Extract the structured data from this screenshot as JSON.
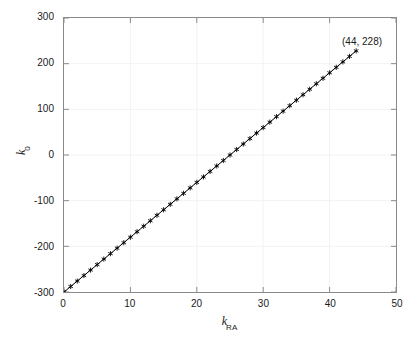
{
  "chart_data": {
    "type": "line",
    "title": "",
    "subtitle": "",
    "xlabel": "k_RA",
    "xlabel_base": "k",
    "xlabel_sub": "RA",
    "ylabel": "k_0",
    "ylabel_base": "k",
    "ylabel_sub": "0",
    "xlim": [
      0,
      50
    ],
    "ylim": [
      -300,
      300
    ],
    "xticks": [
      0,
      10,
      20,
      30,
      40,
      50
    ],
    "yticks": [
      -300,
      -200,
      -100,
      0,
      100,
      200,
      300
    ],
    "xtick_labels": [
      "0",
      "10",
      "20",
      "30",
      "40",
      "50"
    ],
    "ytick_labels": [
      "-300",
      "-200",
      "-100",
      "0",
      "100",
      "200",
      "300"
    ],
    "grid": true,
    "grid_color": "#f2f2f2",
    "legend": null,
    "marker": "asterisk",
    "marker_color": "#000000",
    "line_color": "#000000",
    "axes_color": "#8a8a8a",
    "annotations": [
      {
        "text": "(44, 228)",
        "x": 44,
        "y": 228,
        "label_x": 40.5,
        "label_y": 272
      }
    ],
    "series": [
      {
        "name": "k0 vs kRA",
        "x": [
          0,
          1,
          2,
          3,
          4,
          5,
          6,
          7,
          8,
          9,
          10,
          11,
          12,
          13,
          14,
          15,
          16,
          17,
          18,
          19,
          20,
          21,
          22,
          23,
          24,
          25,
          26,
          27,
          28,
          29,
          30,
          31,
          32,
          33,
          34,
          35,
          36,
          37,
          38,
          39,
          40,
          41,
          42,
          43,
          44
        ],
        "y": [
          -300,
          -288,
          -276,
          -264,
          -252,
          -240,
          -228,
          -216,
          -204,
          -192,
          -180,
          -168,
          -156,
          -144,
          -132,
          -120,
          -108,
          -96,
          -84,
          -72,
          -60,
          -48,
          -36,
          -24,
          -12,
          0,
          12,
          24,
          36,
          48,
          60,
          72,
          84,
          96,
          108,
          120,
          132,
          144,
          156,
          168,
          180,
          192,
          204,
          216,
          228
        ]
      }
    ]
  }
}
